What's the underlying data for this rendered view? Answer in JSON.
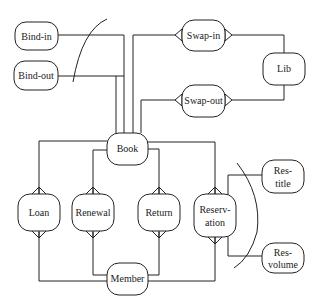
{
  "diagram": {
    "type": "entity-relationship",
    "nodes": {
      "bind_in": {
        "label": "Bind-in"
      },
      "bind_out": {
        "label": "Bind-out"
      },
      "swap_in": {
        "label": "Swap-in"
      },
      "swap_out": {
        "label": "Swap-out"
      },
      "lib": {
        "label": "Lib"
      },
      "book": {
        "label": "Book"
      },
      "loan": {
        "label": "Loan"
      },
      "renewal": {
        "label": "Renewal"
      },
      "return": {
        "label": "Return"
      },
      "reservation": {
        "label_line1": "Reserv-",
        "label_line2": "ation"
      },
      "res_title": {
        "label_line1": "Res-",
        "label_line2": "title"
      },
      "res_volume": {
        "label_line1": "Res-",
        "label_line2": "volume"
      },
      "member": {
        "label": "Member"
      }
    },
    "edges": [
      {
        "from": "Bind-in",
        "to": "Book"
      },
      {
        "from": "Bind-out",
        "to": "Book"
      },
      {
        "from": "Swap-in",
        "to": "Book"
      },
      {
        "from": "Swap-out",
        "to": "Book"
      },
      {
        "from": "Swap-in",
        "to": "Lib"
      },
      {
        "from": "Swap-out",
        "to": "Lib"
      },
      {
        "from": "Book",
        "to": "Loan"
      },
      {
        "from": "Book",
        "to": "Renewal"
      },
      {
        "from": "Book",
        "to": "Return"
      },
      {
        "from": "Book",
        "to": "Reservation"
      },
      {
        "from": "Member",
        "to": "Loan"
      },
      {
        "from": "Member",
        "to": "Renewal"
      },
      {
        "from": "Member",
        "to": "Return"
      },
      {
        "from": "Member",
        "to": "Reservation"
      },
      {
        "from": "Reservation",
        "to": "Res-title"
      },
      {
        "from": "Reservation",
        "to": "Res-volume"
      }
    ]
  }
}
